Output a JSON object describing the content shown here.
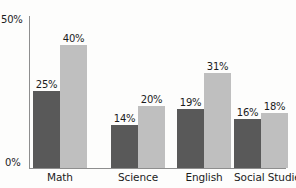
{
  "chart_data": {
    "type": "bar",
    "title": "",
    "subtitle": "",
    "xlabel": "",
    "ylabel": "",
    "categories": [
      "Math",
      "Science",
      "English",
      "Social Studies"
    ],
    "series": [
      {
        "name": "series-1",
        "color": "#595959",
        "values": [
          25,
          40,
          19,
          16
        ]
      },
      {
        "name": "series-2",
        "color": "#bfbfbf",
        "values": [
          40,
          20,
          31,
          18
        ]
      }
    ],
    "grouped_values": [
      {
        "category": "Math",
        "dark": 25,
        "light": 40
      },
      {
        "category": "Science",
        "dark": 14,
        "light": 20
      },
      {
        "category": "English",
        "dark": 19,
        "light": 31
      },
      {
        "category": "Social Studies",
        "dark": 16,
        "light": 18
      }
    ],
    "data_labels": {
      "math": {
        "dark": "25%",
        "light": "40%"
      },
      "science": {
        "dark": "14%",
        "light": "20%"
      },
      "english": {
        "dark": "19%",
        "light": "31%"
      },
      "social_studies": {
        "dark": "16%",
        "light": "18%"
      }
    },
    "ylim": [
      0,
      50
    ],
    "y_ticks": [
      "0%",
      "50%"
    ],
    "y_tick_top": "50%",
    "y_tick_zero": "0%",
    "grid": false,
    "legend": false,
    "legend_position": "none",
    "colors": {
      "series_dark": "#595959",
      "series_light": "#bfbfbf",
      "axis": "#8e8e8e",
      "text": "#1c1c1c",
      "background": "#fdfdfc"
    }
  },
  "axis": {
    "y_top_label": "50%",
    "y_zero_label": "0%"
  },
  "bars": [
    {
      "category": "Math",
      "dark_label": "25%",
      "light_label": "40%"
    },
    {
      "category": "Science",
      "dark_label": "14%",
      "light_label": "20%"
    },
    {
      "category": "English",
      "dark_label": "19%",
      "light_label": "31%"
    },
    {
      "category": "Social Studies",
      "dark_label": "16%",
      "light_label": "18%"
    }
  ],
  "categories": {
    "c0": "Math",
    "c1": "Science",
    "c2": "English",
    "c3": "Social Studies"
  }
}
